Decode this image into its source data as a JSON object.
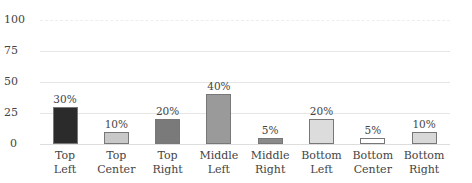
{
  "chart_data": {
    "type": "bar",
    "title": "",
    "xlabel": "",
    "ylabel": "",
    "ylim": [
      0,
      100
    ],
    "yticks": [
      "100",
      "75",
      "50",
      "25",
      "0"
    ],
    "grid": true,
    "legend": null,
    "categories": [
      "Top Left",
      "Top Center",
      "Top Right",
      "Middle Left",
      "Middle Right",
      "Bottom Left",
      "Bottom Center",
      "Bottom Right"
    ],
    "category_lines": [
      [
        "Top",
        "Left"
      ],
      [
        "Top",
        "Center"
      ],
      [
        "Top",
        "Right"
      ],
      [
        "Middle",
        "Left"
      ],
      [
        "Middle",
        "Right"
      ],
      [
        "Bottom",
        "Left"
      ],
      [
        "Bottom",
        "Center"
      ],
      [
        "Bottom",
        "Right"
      ]
    ],
    "values": [
      30,
      10,
      20,
      40,
      5,
      20,
      5,
      10
    ],
    "value_labels": [
      "30%",
      "10%",
      "20%",
      "40%",
      "5%",
      "20%",
      "5%",
      "10%"
    ],
    "bar_colors": [
      "#2b2b2b",
      "#c8c8c8",
      "#7a7a7a",
      "#9a9a9a",
      "#8a8a8a",
      "#dcdcdc",
      "#ffffff",
      "#d8d8d8"
    ]
  }
}
